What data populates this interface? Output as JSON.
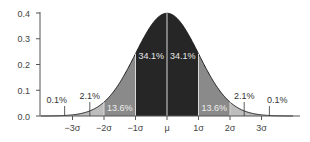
{
  "chart_data": {
    "type": "area",
    "title": "",
    "xlabel": "",
    "ylabel": "",
    "ylim": [
      0,
      0.4
    ],
    "xlim": [
      -4,
      4.3
    ],
    "grid": false,
    "legend": "none",
    "curve": "standard normal probability density function",
    "yticks": [
      "0.0",
      "0.1",
      "0.2",
      "0.3",
      "0.4"
    ],
    "ytick_values": [
      0.0,
      0.1,
      0.2,
      0.3,
      0.4
    ],
    "xticks": [
      "−3σ",
      "−2σ",
      "−1σ",
      "μ",
      "1σ",
      "2σ",
      "3σ"
    ],
    "xtick_values": [
      -3,
      -2,
      -1,
      0,
      1,
      2,
      3
    ],
    "regions": [
      {
        "from": -4,
        "to": -3,
        "percent": "0.1%",
        "shade": "#e8e8e8"
      },
      {
        "from": -3,
        "to": -2,
        "percent": "2.1%",
        "shade": "#bdbdbd"
      },
      {
        "from": -2,
        "to": -1,
        "percent": "13.6%",
        "shade": "#8a8a8a"
      },
      {
        "from": -1,
        "to": 0,
        "percent": "34.1%",
        "shade": "#262626"
      },
      {
        "from": 0,
        "to": 1,
        "percent": "34.1%",
        "shade": "#262626"
      },
      {
        "from": 1,
        "to": 2,
        "percent": "13.6%",
        "shade": "#8a8a8a"
      },
      {
        "from": 2,
        "to": 3,
        "percent": "2.1%",
        "shade": "#bdbdbd"
      },
      {
        "from": 3,
        "to": 4,
        "percent": "0.1%",
        "shade": "#e8e8e8"
      }
    ],
    "annotations": [
      {
        "text": "0.1%",
        "x": -3.5,
        "pointer_x": -3.25
      },
      {
        "text": "2.1%",
        "x": -2.45,
        "pointer_x": -2.45
      },
      {
        "text": "13.6%",
        "x": -1.5,
        "inside": true
      },
      {
        "text": "34.1%",
        "x": -0.5,
        "inside": true
      },
      {
        "text": "34.1%",
        "x": 0.5,
        "inside": true
      },
      {
        "text": "13.6%",
        "x": 1.5,
        "inside": true
      },
      {
        "text": "2.1%",
        "x": 2.45,
        "pointer_x": 2.45
      },
      {
        "text": "0.1%",
        "x": 3.5,
        "pointer_x": 3.25
      }
    ]
  }
}
